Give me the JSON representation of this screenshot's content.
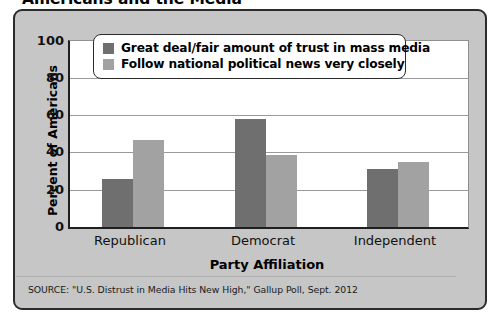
{
  "title": "Americans and the Media",
  "source_note": "SOURCE: \"U.S. Distrust in Media Hits New High,\" Gallup Poll, Sept. 2012",
  "colors": {
    "series_trust": "#6f6f6f",
    "series_follow": "#a2a2a2",
    "panel_background": "#c6c6c6",
    "plot_background": "#ffffff",
    "frame_border": "#2b2b2b",
    "gridline": "#9a9a9a",
    "text": "#000000"
  },
  "chart_data": {
    "type": "bar",
    "title": "Americans and the Media",
    "xlabel": "Party Affiliation",
    "ylabel": "Percent of Americans",
    "categories": [
      "Republican",
      "Democrat",
      "Independent"
    ],
    "series": [
      {
        "name": "Great deal/fair amount of trust in mass media",
        "color": "#6f6f6f",
        "values": [
          26,
          58,
          31
        ]
      },
      {
        "name": "Follow national political news very closely",
        "color": "#a2a2a2",
        "values": [
          47,
          39,
          35
        ]
      }
    ],
    "ylim": [
      0,
      100
    ],
    "yticks": [
      0,
      20,
      40,
      60,
      80,
      100
    ],
    "ytick_labels": [
      "0",
      "20",
      "40",
      "60",
      "80",
      "100"
    ],
    "grid": true,
    "legend_position": "upper center"
  }
}
